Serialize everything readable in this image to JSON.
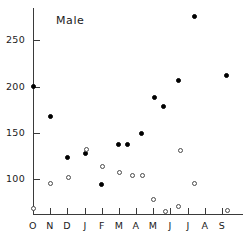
{
  "chart_data": {
    "type": "scatter",
    "title": "Male",
    "xlabel": "",
    "ylabel": "",
    "grid": false,
    "legend_position": "none",
    "ylim": [
      62,
      285
    ],
    "yticks": [
      100,
      150,
      200,
      250
    ],
    "ytick_labels": [
      "100",
      "150",
      "200",
      "250"
    ],
    "xtick_labels": [
      "O",
      "N",
      "D",
      "J",
      "F",
      "M",
      "A",
      "M",
      "J",
      "J",
      "A",
      "S"
    ],
    "xlim": [
      0,
      12
    ],
    "series": [
      {
        "name": "filled-circles",
        "marker": "filled-circle",
        "color": "#000000",
        "points": [
          {
            "x": 0.0,
            "y": 200,
            "month": "O"
          },
          {
            "x": 1.0,
            "y": 168,
            "month": "N"
          },
          {
            "x": 2.0,
            "y": 123,
            "month": "D"
          },
          {
            "x": 3.05,
            "y": 127,
            "month": "J"
          },
          {
            "x": 4.0,
            "y": 94,
            "month": "F"
          },
          {
            "x": 5.0,
            "y": 137,
            "month": "M"
          },
          {
            "x": 5.5,
            "y": 137,
            "month": "M"
          },
          {
            "x": 6.3,
            "y": 149,
            "month": "A"
          },
          {
            "x": 7.05,
            "y": 188,
            "month": "M"
          },
          {
            "x": 7.6,
            "y": 178,
            "month": "M"
          },
          {
            "x": 8.5,
            "y": 207,
            "month": "J"
          },
          {
            "x": 9.4,
            "y": 276,
            "month": "J"
          },
          {
            "x": 11.3,
            "y": 212,
            "month": "S"
          }
        ]
      },
      {
        "name": "open-circles",
        "marker": "open-circle",
        "color": "#4a4a4a",
        "points": [
          {
            "x": 0.0,
            "y": 68,
            "month": "O"
          },
          {
            "x": 1.0,
            "y": 95,
            "month": "N"
          },
          {
            "x": 2.05,
            "y": 101,
            "month": "D"
          },
          {
            "x": 3.1,
            "y": 132,
            "month": "J"
          },
          {
            "x": 4.05,
            "y": 113,
            "month": "F"
          },
          {
            "x": 5.05,
            "y": 107,
            "month": "M"
          },
          {
            "x": 5.8,
            "y": 104,
            "month": "A"
          },
          {
            "x": 6.4,
            "y": 104,
            "month": "A"
          },
          {
            "x": 7.0,
            "y": 78,
            "month": "M"
          },
          {
            "x": 7.7,
            "y": 65,
            "month": "M"
          },
          {
            "x": 8.5,
            "y": 70,
            "month": "J"
          },
          {
            "x": 8.6,
            "y": 131,
            "month": "J"
          },
          {
            "x": 9.4,
            "y": 95,
            "month": "J"
          },
          {
            "x": 11.35,
            "y": 66,
            "month": "S"
          }
        ]
      }
    ]
  },
  "geometry": {
    "title_x": 56,
    "title_y": 14,
    "plot_left": 33,
    "plot_right": 239,
    "plot_top": 8,
    "plot_bottom": 214,
    "y_axis_top": 8,
    "y_val_at_top": 285,
    "y_val_at_bottom": 62
  }
}
